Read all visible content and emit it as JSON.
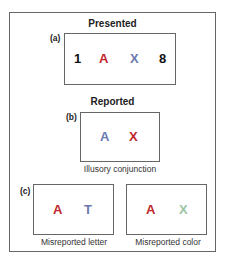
{
  "sections": {
    "presented": {
      "title": "Presented",
      "label": "(a)",
      "items": [
        {
          "char": "1",
          "color": "#111111"
        },
        {
          "char": "A",
          "color": "#c0272d"
        },
        {
          "char": "X",
          "color": "#6a7ab0"
        },
        {
          "char": "8",
          "color": "#111111"
        }
      ]
    },
    "reported": {
      "title": "Reported",
      "b": {
        "label": "(b)",
        "items": [
          {
            "char": "A",
            "color": "#6a7ab0"
          },
          {
            "char": "X",
            "color": "#c0272d"
          }
        ],
        "caption": "Illusory conjunction"
      },
      "c": {
        "label": "(c)",
        "left": {
          "items": [
            {
              "char": "A",
              "color": "#c0272d"
            },
            {
              "char": "T",
              "color": "#6a7ab0"
            }
          ],
          "caption": "Misreported letter"
        },
        "right": {
          "items": [
            {
              "char": "A",
              "color": "#c0272d"
            },
            {
              "char": "X",
              "color": "#9cc4a4"
            }
          ],
          "caption": "Misreported color"
        }
      }
    }
  }
}
